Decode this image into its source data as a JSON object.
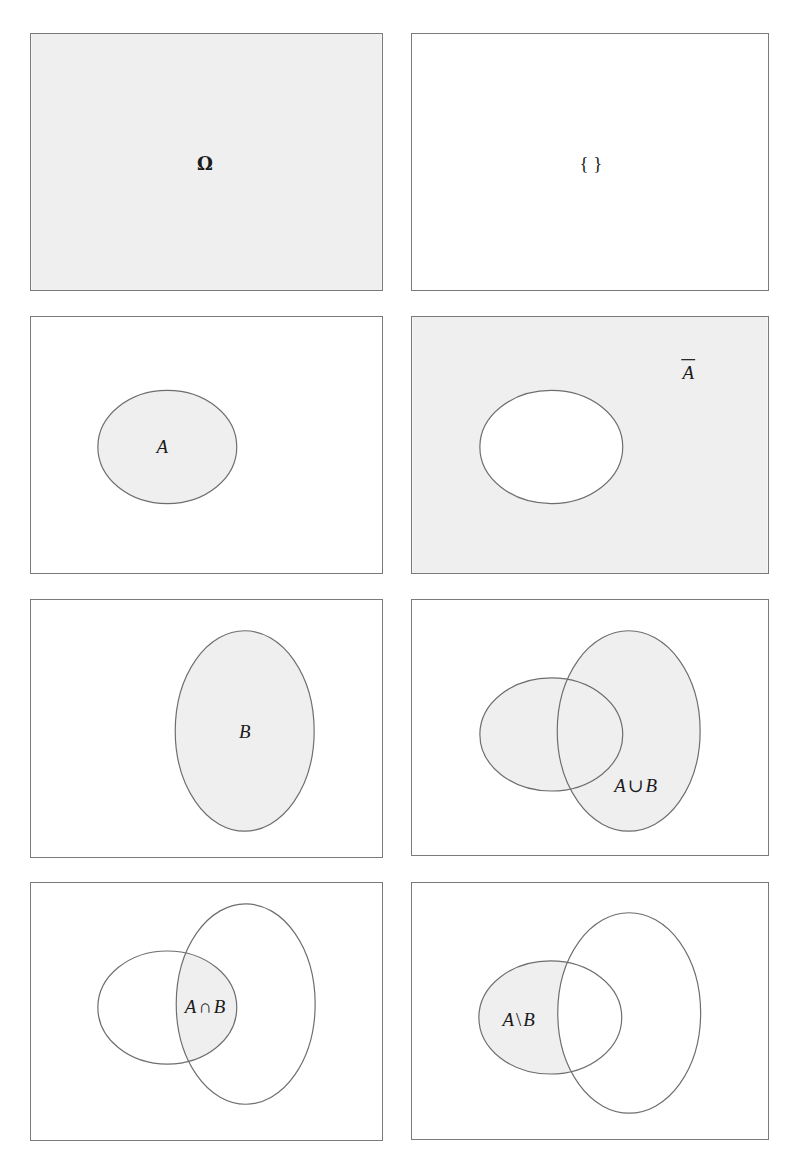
{
  "figure": {
    "colors": {
      "shade": "#efefef",
      "outline": "#6e6e6e",
      "background": "#ffffff",
      "text": "#1a1a1a"
    },
    "panels": [
      {
        "id": "universal-set",
        "label": "Ω",
        "shaded": "all"
      },
      {
        "id": "empty-set",
        "label": "{ }",
        "shaded": "none"
      },
      {
        "id": "set-a",
        "label": "A",
        "shaded": "A"
      },
      {
        "id": "complement-a",
        "label": "A",
        "label_overline": true,
        "shaded": "complement of A"
      },
      {
        "id": "set-b",
        "label": "B",
        "shaded": "B"
      },
      {
        "id": "union",
        "label_parts": [
          "A",
          "∪",
          "B"
        ],
        "shaded": "A union B"
      },
      {
        "id": "intersection",
        "label_parts": [
          "A",
          "∩",
          "B"
        ],
        "shaded": "A intersect B"
      },
      {
        "id": "difference",
        "label_parts": [
          "A",
          "\\",
          "B"
        ],
        "shaded": "A minus B"
      }
    ]
  }
}
